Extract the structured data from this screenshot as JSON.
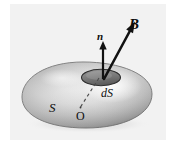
{
  "figure": {
    "background_color": "#ffffff",
    "panel_color": "#f2f2f2",
    "ink_color": "#0d0d0d",
    "labels": {
      "field_vector": "B",
      "normal_vector": "n",
      "surface_element": "dS",
      "surface": "S",
      "origin": "O"
    },
    "elements": {
      "surface_name": "closed-surface-blob",
      "patch_name": "surface-element-patch",
      "normal_arrow_name": "normal-vector-arrow",
      "field_arrow_name": "magnetic-field-arrow",
      "radius_line_name": "dashed-radius-line",
      "origin_point_name": "origin-marker"
    },
    "geometry": {
      "blob": {
        "center_x": 87,
        "center_y": 95,
        "radius_x": 65,
        "radius_y": 33
      },
      "patch": {
        "center_x": 101,
        "center_y": 77,
        "radius_x": 19,
        "radius_y": 8
      },
      "normal_arrow": {
        "x1": 103,
        "y1": 79,
        "x2": 103,
        "y2": 42
      },
      "field_arrow": {
        "x1": 104,
        "y1": 79,
        "x2": 134,
        "y2": 24
      },
      "dashed_line": {
        "x1": 99,
        "y1": 79,
        "x2": 80,
        "y2": 108
      }
    },
    "colors": {
      "surface_light": "#fdfdfd",
      "surface_mid": "#c9c9c9",
      "surface_dark": "#8e8e8e",
      "surface_edge": "#6f6f6f",
      "patch_fill": "#6e6e6e",
      "patch_edge": "#3a3a3a",
      "arrow": "#111111",
      "dash": "#4a4a4a"
    }
  }
}
